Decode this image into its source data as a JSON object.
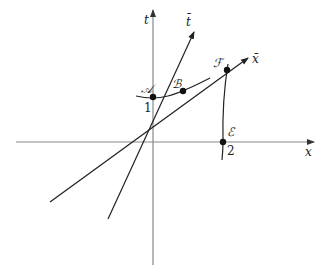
{
  "diagram": {
    "type": "spacetime-diagram",
    "axes": {
      "x_label": "x",
      "t_label": "t",
      "xbar_label": "x̄",
      "tbar_label": "t̄"
    },
    "ticks": {
      "t_one": "1",
      "x_two": "2"
    },
    "points": {
      "A": "𝒜",
      "B": "ℬ",
      "E": "ℰ",
      "F": "ℱ"
    },
    "colors": {
      "axis": "#888888",
      "line": "#222222",
      "point": "#111111"
    }
  }
}
